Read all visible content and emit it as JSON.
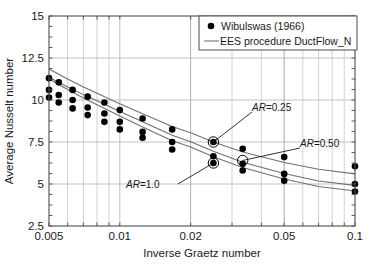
{
  "figure": {
    "background": "#ffffff",
    "frame_color": "#4d4d4d",
    "grid_color": "#b3b3b3",
    "marker_color": "#000000",
    "line_color": "#707070"
  },
  "legend": {
    "entries": [
      {
        "label": "Wibulswas (1966)",
        "marker": "filled-circle"
      },
      {
        "label": "EES procedure DuctFlow_N",
        "marker": "line"
      }
    ]
  },
  "annotations": [
    {
      "name": "ar-025",
      "prefix": "AR",
      "text": "AR=0.25",
      "value": "0.25"
    },
    {
      "name": "ar-050",
      "prefix": "AR",
      "text": "AR=0.50",
      "value": "0.50"
    },
    {
      "name": "ar-100",
      "prefix": "AR",
      "text": "AR=1.0",
      "value": "1.0"
    }
  ],
  "chart_data": {
    "type": "scatter",
    "title": "",
    "xlabel": "Inverse Graetz number",
    "ylabel": "Average Nusselt number",
    "xscale": "log",
    "yscale": "linear",
    "xlim": [
      0.005,
      0.1
    ],
    "ylim": [
      2.5,
      15
    ],
    "xticks": [
      0.005,
      0.01,
      0.02,
      0.05,
      0.1
    ],
    "xticklabels": [
      "0.005",
      "0.01",
      "0.02",
      "0.05",
      "0.1"
    ],
    "yticks": [
      2.5,
      5,
      7.5,
      10,
      12.5,
      15
    ],
    "yticklabels": [
      "2.5",
      "5",
      "7.5",
      "10",
      "12.5",
      "15"
    ],
    "grid": true,
    "grid_minor_x": true,
    "legend_position": "upper-right",
    "series": [
      {
        "name": "Wibulswas (1966)",
        "type": "scatter",
        "marker": "filled-circle",
        "points": [
          [
            0.005,
            11.3
          ],
          [
            0.005,
            10.6
          ],
          [
            0.005,
            10.15
          ],
          [
            0.0055,
            11.05
          ],
          [
            0.0055,
            10.3
          ],
          [
            0.0055,
            9.85
          ],
          [
            0.0063,
            10.6
          ],
          [
            0.0063,
            10.0
          ],
          [
            0.0063,
            9.5
          ],
          [
            0.0073,
            10.2
          ],
          [
            0.0073,
            9.55
          ],
          [
            0.0073,
            9.1
          ],
          [
            0.0086,
            9.85
          ],
          [
            0.0086,
            9.2
          ],
          [
            0.0086,
            8.7
          ],
          [
            0.01,
            9.4
          ],
          [
            0.01,
            8.7
          ],
          [
            0.01,
            8.25
          ],
          [
            0.0125,
            8.9
          ],
          [
            0.0125,
            8.1
          ],
          [
            0.0125,
            7.75
          ],
          [
            0.0167,
            8.25
          ],
          [
            0.0167,
            7.5
          ],
          [
            0.0167,
            7.05
          ],
          [
            0.025,
            7.5
          ],
          [
            0.025,
            6.65
          ],
          [
            0.025,
            6.25
          ],
          [
            0.0333,
            7.1
          ],
          [
            0.0333,
            6.2
          ],
          [
            0.0333,
            5.8
          ],
          [
            0.05,
            6.6
          ],
          [
            0.05,
            5.6
          ],
          [
            0.05,
            5.2
          ],
          [
            0.1,
            6.05
          ],
          [
            0.1,
            5.0
          ],
          [
            0.1,
            4.55
          ]
        ]
      },
      {
        "name": "EES procedure DuctFlow_N AR=0.25",
        "type": "line",
        "ar": "0.25",
        "x": [
          0.005,
          0.006,
          0.007,
          0.008,
          0.01,
          0.0125,
          0.0167,
          0.02,
          0.025,
          0.0333,
          0.05,
          0.07,
          0.1
        ],
        "y": [
          11.85,
          11.25,
          10.78,
          10.4,
          9.78,
          9.18,
          8.42,
          8.05,
          7.5,
          6.9,
          6.28,
          5.88,
          5.6
        ]
      },
      {
        "name": "EES procedure DuctFlow_N AR=0.50",
        "type": "line",
        "ar": "0.50",
        "x": [
          0.005,
          0.006,
          0.007,
          0.008,
          0.01,
          0.0125,
          0.0167,
          0.02,
          0.025,
          0.0333,
          0.05,
          0.07,
          0.1
        ],
        "y": [
          11.35,
          10.78,
          10.32,
          9.95,
          9.32,
          8.7,
          7.9,
          7.52,
          6.95,
          6.3,
          5.62,
          5.18,
          4.92
        ]
      },
      {
        "name": "EES procedure DuctFlow_N AR=1.0",
        "type": "line",
        "ar": "1.0",
        "x": [
          0.005,
          0.006,
          0.007,
          0.008,
          0.01,
          0.0125,
          0.0167,
          0.02,
          0.025,
          0.0333,
          0.05,
          0.07,
          0.1
        ],
        "y": [
          11.25,
          10.62,
          10.12,
          9.72,
          9.05,
          8.4,
          7.58,
          7.2,
          6.62,
          5.98,
          5.3,
          4.85,
          4.58
        ]
      }
    ],
    "highlighted_points": [
      {
        "label": "AR=0.25",
        "x": 0.025,
        "y": 7.5
      },
      {
        "label": "AR=0.50",
        "x": 0.0333,
        "y": 6.4
      },
      {
        "label": "AR=1.0",
        "x": 0.025,
        "y": 6.25
      }
    ]
  }
}
